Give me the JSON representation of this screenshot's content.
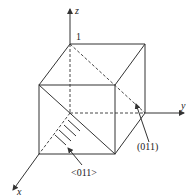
{
  "diagram": {
    "axes": {
      "x": "x",
      "y": "y",
      "z": "z"
    },
    "unit_label": "1",
    "plane_label": "(011)",
    "direction_label": "<011>",
    "colors": {
      "line": "#333333",
      "background": "#ffffff"
    }
  }
}
